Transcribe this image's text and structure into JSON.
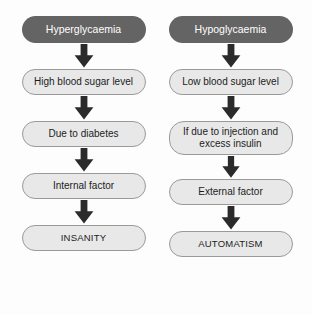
{
  "diagram": {
    "background_color": "#fdfdfd",
    "header_fill": "#646464",
    "header_text_color": "#ffffff",
    "step_fill": "#e8e8e8",
    "step_border_color": "#9a9a9a",
    "step_text_color": "#1c1c1c",
    "arrow_color": "#2b2b2b",
    "columns": [
      {
        "id": "hyperglycaemia",
        "header": "Hyperglycaemia",
        "steps": [
          {
            "text": "High blood sugar level",
            "lines": [
              "High blood sugar level"
            ]
          },
          {
            "text": "Due to diabetes",
            "lines": [
              "Due to diabetes"
            ]
          },
          {
            "text": "Internal factor",
            "lines": [
              "Internal factor"
            ]
          },
          {
            "text": "INSANITY",
            "lines": [
              "INSANITY"
            ]
          }
        ]
      },
      {
        "id": "hypoglycaemia",
        "header": "Hypoglycaemia",
        "steps": [
          {
            "text": "Low blood sugar level",
            "lines": [
              "Low blood sugar level"
            ]
          },
          {
            "text": "If due to injection and excess insulin",
            "lines": [
              "If due to injection and",
              "excess insulin"
            ]
          },
          {
            "text": "External factor",
            "lines": [
              "External factor"
            ]
          },
          {
            "text": "AUTOMATISM",
            "lines": [
              "AUTOMATISM"
            ]
          }
        ]
      }
    ]
  }
}
